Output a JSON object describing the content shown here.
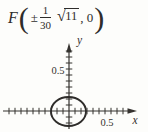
{
  "formula": {
    "function_name": "F",
    "open_paren": "(",
    "plus_minus": "±",
    "fraction": {
      "numerator": "1",
      "denominator": "30"
    },
    "radical": {
      "sign": "√",
      "radicand": "11"
    },
    "rest": ", 0",
    "close_paren": ")"
  },
  "graph": {
    "x_axis_label": "x",
    "y_axis_label": "y",
    "x_tick_label": "0.5",
    "y_tick_label": "0.5",
    "tick_step_units": 0.1,
    "ellipse": {
      "center_x": 0,
      "center_y": 0
    },
    "colors": {
      "ink": "#35322f",
      "background": "#fdfdfb"
    }
  }
}
